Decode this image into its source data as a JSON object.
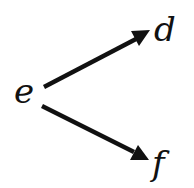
{
  "diagram": {
    "type": "tree",
    "nodes": [
      {
        "id": "e",
        "label": "e"
      },
      {
        "id": "d",
        "label": "d"
      },
      {
        "id": "f",
        "label": "f"
      }
    ],
    "edges": [
      {
        "from": "e",
        "to": "d",
        "directed": true
      },
      {
        "from": "e",
        "to": "f",
        "directed": true
      }
    ],
    "colors": {
      "stroke": "#111111",
      "background": "#ffffff"
    }
  }
}
